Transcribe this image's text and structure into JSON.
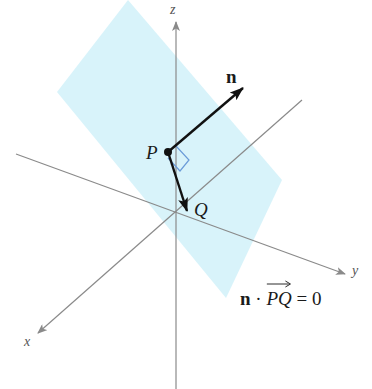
{
  "figure": {
    "type": "3d-plane-normal-vector",
    "colors": {
      "plane_fill": "#d6f2fa",
      "axis": "#8a8a8a",
      "vector": "#111111",
      "right_angle_marker": "#6a9bd8"
    },
    "axes": {
      "x_label": "x",
      "y_label": "y",
      "z_label": "z"
    },
    "points": {
      "P_label": "P",
      "Q_label": "Q"
    },
    "vectors": {
      "normal_label": "n"
    },
    "equation": {
      "n": "n",
      "dot": "·",
      "pq": "PQ",
      "rhs": "= 0"
    }
  }
}
